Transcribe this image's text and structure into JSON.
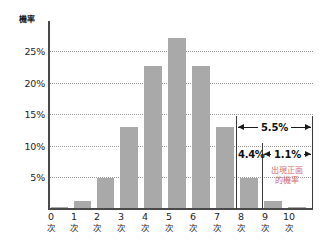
{
  "chart_data": {
    "type": "bar",
    "title": "",
    "subtitle": "",
    "xlabel": "",
    "ylabel": "機率",
    "categories": [
      "0次",
      "1次",
      "2次",
      "3次",
      "4次",
      "5次",
      "6次",
      "7次",
      "8次",
      "9次",
      "10次"
    ],
    "category_numbers": [
      "0",
      "1",
      "2",
      "3",
      "4",
      "5",
      "6",
      "7",
      "8",
      "9",
      "10"
    ],
    "category_unit": "次",
    "values": [
      0.1,
      1.0,
      4.4,
      11.7,
      20.5,
      24.6,
      20.5,
      11.7,
      4.4,
      1.0,
      0.1
    ],
    "ylim": [
      0,
      27
    ],
    "yticks": [
      5,
      10,
      15,
      20,
      25
    ],
    "ytick_labels": [
      "5%",
      "10%",
      "15%",
      "20%",
      "25%"
    ],
    "grid": true,
    "grid_axis": "y",
    "legend": null,
    "bar_color": "#a9a9a9",
    "axis_color": "#4a4a4a",
    "grid_color": "#9a9a9a",
    "annotations": [
      {
        "name": "range-5-5",
        "label": "5.5%",
        "from": "8次",
        "to": "10次",
        "style": "double-arrow"
      },
      {
        "name": "value-4-4",
        "label": "4.4%",
        "at": "8次",
        "style": "text"
      },
      {
        "name": "range-1-1",
        "label": "1.1%",
        "from": "9次",
        "to": "10次",
        "style": "double-arrow"
      },
      {
        "name": "note-heads-probability",
        "label_line1": "出現正面",
        "label_line2": "的機率",
        "color": "#d06a72"
      }
    ]
  },
  "colors": {
    "bar": "#a9a9a9",
    "axis": "#4a4a4a",
    "grid": "#9a9a9a",
    "annotation_text": "#111111",
    "note_red": "#d06a72",
    "background": "#ffffff"
  }
}
